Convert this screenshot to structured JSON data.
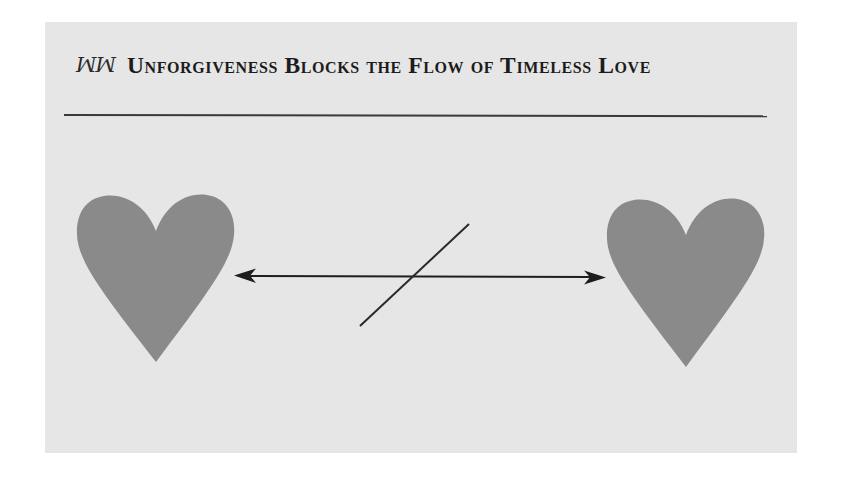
{
  "header": {
    "ornament_icon": "ꔹ",
    "ornament_text": "꩜ꭃ",
    "title": "Unforgiveness Blocks the Flow of Timeless Love"
  },
  "diagram": {
    "left_node": "heart",
    "right_node": "heart",
    "connector": "double-headed-arrow",
    "blocker": "diagonal-slash",
    "colors": {
      "background": "#e6e6e6",
      "heart": "#8a8a8a",
      "line": "#1e1e1e",
      "rule": "#3a3a3a"
    }
  }
}
